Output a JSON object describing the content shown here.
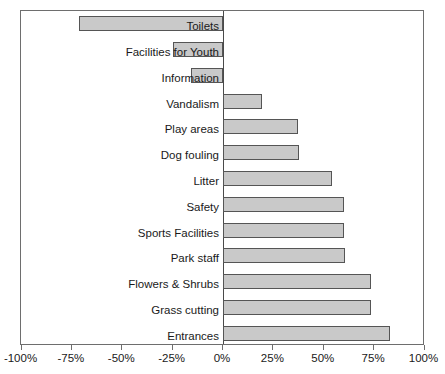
{
  "chart_data": {
    "type": "bar",
    "orientation": "horizontal",
    "title": "",
    "subtitle": "",
    "xlabel": "",
    "ylabel": "",
    "xlim": [
      -100,
      100
    ],
    "grid": false,
    "legend": null,
    "zero_axis": 0,
    "tick_labels": [
      "-100%",
      "-75%",
      "-50%",
      "-25%",
      "0%",
      "25%",
      "50%",
      "75%",
      "100%"
    ],
    "tick_values": [
      -100,
      -75,
      -50,
      -25,
      0,
      25,
      50,
      75,
      100
    ],
    "categories": [
      "Toilets",
      "Facilities for Youth",
      "Information",
      "Vandalism",
      "Play areas",
      "Dog fouling",
      "Litter",
      "Safety",
      "Sports Facilities",
      "Park staff",
      "Flowers & Shrubs",
      "Grass cutting",
      "Entrances"
    ],
    "values": [
      -71.5,
      -25,
      -16,
      19.5,
      37,
      37.5,
      54,
      60,
      60,
      60.5,
      73.5,
      73.5,
      83
    ],
    "value_unit": "%",
    "bar_fill_color": "#c9c9c9",
    "bar_border_color": "#555555",
    "axis_color": "#6e6e6e"
  }
}
